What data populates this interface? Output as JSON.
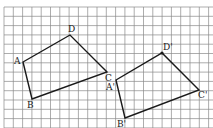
{
  "figure": {
    "grid": {
      "x0": 4,
      "y0": 7,
      "spacing": 9.3,
      "cols": 22,
      "rows": 13,
      "color": "#8a8a8a"
    },
    "original": {
      "name": "ABCD",
      "vertices": [
        {
          "label": "A",
          "x": 23,
          "y": 62,
          "lx": 14,
          "ly": 64
        },
        {
          "label": "B",
          "x": 32,
          "y": 99,
          "lx": 27,
          "ly": 108
        },
        {
          "label": "C",
          "x": 107,
          "y": 72,
          "lx": 105,
          "ly": 81
        },
        {
          "label": "D",
          "x": 70,
          "y": 35,
          "lx": 68,
          "ly": 32
        }
      ]
    },
    "image": {
      "name": "A'B'C'D'",
      "vertices": [
        {
          "label": "A'",
          "x": 116,
          "y": 80,
          "lx": 106,
          "ly": 90
        },
        {
          "label": "B'",
          "x": 125,
          "y": 118,
          "lx": 117,
          "ly": 127
        },
        {
          "label": "C'",
          "x": 199,
          "y": 90,
          "lx": 198,
          "ly": 98
        },
        {
          "label": "D'",
          "x": 162,
          "y": 53,
          "lx": 163,
          "ly": 50
        }
      ]
    },
    "translation": {
      "dx": 93,
      "dy": 18
    }
  }
}
